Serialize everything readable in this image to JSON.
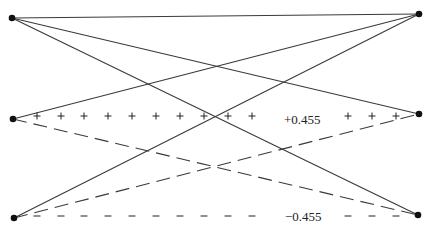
{
  "diagram": {
    "nodes": [
      {
        "id": "top-left",
        "x": 12,
        "y": 18
      },
      {
        "id": "top-right",
        "x": 419,
        "y": 14
      },
      {
        "id": "mid-left",
        "x": 13,
        "y": 119
      },
      {
        "id": "mid-right",
        "x": 419,
        "y": 114
      },
      {
        "id": "bottom-left",
        "x": 14,
        "y": 218
      },
      {
        "id": "bottom-right",
        "x": 418,
        "y": 215
      }
    ],
    "solid_edges": [
      [
        "top-left",
        "top-right"
      ],
      [
        "top-left",
        "mid-right"
      ],
      [
        "top-left",
        "bottom-right"
      ],
      [
        "mid-left",
        "top-right"
      ],
      [
        "bottom-left",
        "top-right"
      ]
    ],
    "dashed_edges": [
      [
        "mid-left",
        "bottom-right"
      ],
      [
        "bottom-left",
        "mid-right"
      ]
    ],
    "positive_row": {
      "label": "+0.455",
      "symbol": "+",
      "xs": [
        37,
        61,
        84,
        108,
        132,
        156,
        180,
        204,
        228,
        252,
        348,
        372,
        396
      ]
    },
    "negative_row": {
      "label": "−0.455",
      "symbol": "–",
      "xs": [
        37,
        61,
        84,
        108,
        132,
        156,
        180,
        204,
        228,
        252,
        348,
        372,
        396
      ]
    },
    "colors": {
      "line": "#3a3a3a",
      "node": "#111111",
      "text": "#222222"
    }
  }
}
